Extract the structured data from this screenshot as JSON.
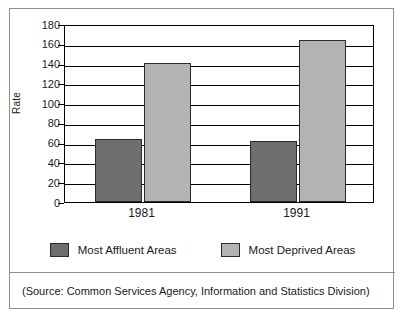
{
  "chart_data": {
    "type": "bar",
    "title": "",
    "xlabel": "",
    "ylabel": "Rate",
    "ylim": [
      0,
      180
    ],
    "ytick_step": 20,
    "yticks": [
      "180",
      "160",
      "140",
      "120",
      "100",
      "80",
      "60",
      "40",
      "20",
      "0"
    ],
    "grid": true,
    "legend_position": "bottom",
    "categories": [
      "1981",
      "1991"
    ],
    "series": [
      {
        "name": "Most Affluent Areas",
        "color": "#6e6e6e",
        "values": [
          64,
          62
        ]
      },
      {
        "name": "Most Deprived Areas",
        "color": "#b3b3b3",
        "values": [
          141,
          164
        ]
      }
    ]
  },
  "legend": {
    "items": [
      {
        "label": "Most Affluent Areas",
        "color": "#6e6e6e"
      },
      {
        "label": "Most Deprived Areas",
        "color": "#b3b3b3"
      }
    ]
  },
  "footer": {
    "source": "(Source: Common Services Agency, Information and Statistics Division)"
  }
}
